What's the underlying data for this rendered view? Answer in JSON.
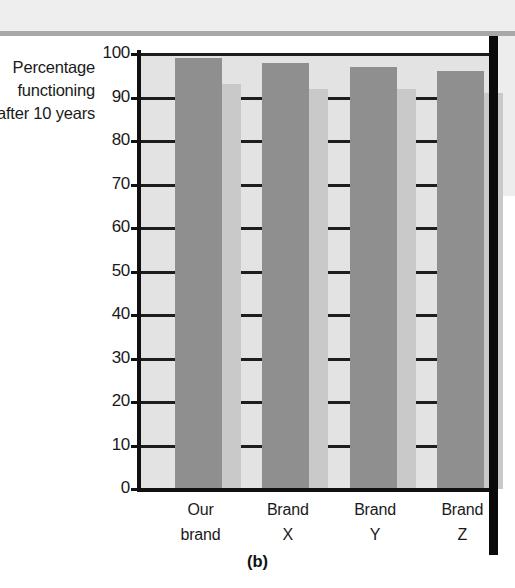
{
  "figure": {
    "caption": "(b)",
    "axis_label_lines": [
      "Percentage",
      "functioning",
      "after 10 years"
    ]
  },
  "colors": {
    "bar_fill": "#8f8f8f",
    "bar_shadow": "#c9c9c9",
    "plot_background": "#e3e3e3",
    "axis": "#111111",
    "gridline": "#1d1d1d",
    "page_band": "#eeeeee",
    "gutter_rule": "#0a0a0a",
    "text": "#1a1a1a"
  },
  "chart_data": {
    "type": "bar",
    "title": "",
    "subtitle": "",
    "categories": [
      "Our brand",
      "Brand X",
      "Brand Y",
      "Brand Z"
    ],
    "category_lines": [
      [
        "Our",
        "brand"
      ],
      [
        "Brand",
        "X"
      ],
      [
        "Brand",
        "Y"
      ],
      [
        "Brand",
        "Z"
      ]
    ],
    "values": [
      99,
      98,
      97,
      96
    ],
    "shadow_values": [
      93,
      92,
      92,
      91
    ],
    "series": [
      {
        "name": "Percentage functioning after 10 years",
        "values": [
          99,
          98,
          97,
          96
        ]
      }
    ],
    "xlabel": "",
    "ylabel": "Percentage functioning after 10 years",
    "ylim": [
      0,
      100
    ],
    "yticks": [
      0,
      10,
      20,
      30,
      40,
      50,
      60,
      70,
      80,
      90,
      100
    ],
    "ytick_labels": [
      "0",
      "10",
      "20",
      "30",
      "40",
      "50",
      "60",
      "70",
      "80",
      "90",
      "100"
    ],
    "grid": true,
    "grid_axis": "y",
    "legend": false,
    "legend_position": "none"
  }
}
